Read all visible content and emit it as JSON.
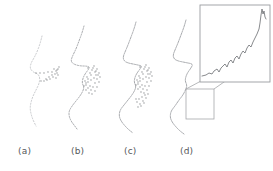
{
  "figure": {
    "type": "multi-panel-scientific-figure",
    "background_color": "#ffffff",
    "width": 273,
    "height": 171,
    "panel_count": 4
  },
  "captions": {
    "a": "(a)",
    "b": "(b)",
    "c": "(c)",
    "d": "(d)"
  },
  "colors": {
    "profile_stroke": "#8d8f94",
    "profile_stroke_light": "#b6b8bc",
    "point_marker": "#6e7074",
    "inset_border": "#9a9ca0",
    "roi_border": "#a5a7ab",
    "connector": "#8e9094",
    "inset_curve": "#6a6c70",
    "caption_text": "#55575a"
  },
  "chart_data": {
    "type": "line",
    "title": "",
    "xlabel": "",
    "ylabel": "",
    "panels": [
      {
        "id": "a",
        "label": "(a)",
        "description": "sparse scattered sample points around mid-face with short horizontal trace, faint partial contour",
        "contour_detail": "minimal",
        "point_count": 22,
        "has_inset": false,
        "has_roi_box": false,
        "contour": [
          [
            42,
            36
          ],
          [
            40,
            44
          ],
          [
            37,
            52
          ],
          [
            34,
            58
          ],
          [
            31,
            63
          ],
          [
            30,
            68
          ],
          [
            32,
            71
          ],
          [
            35,
            73
          ],
          [
            38,
            74
          ],
          [
            40,
            78
          ],
          [
            39,
            84
          ],
          [
            36,
            90
          ],
          [
            33,
            96
          ],
          [
            31,
            102
          ],
          [
            30,
            108
          ],
          [
            31,
            114
          ],
          [
            33,
            120
          ],
          [
            36,
            126
          ]
        ],
        "points": [
          [
            36,
            73
          ],
          [
            40,
            73
          ],
          [
            44,
            73
          ],
          [
            48,
            72
          ],
          [
            52,
            72
          ],
          [
            56,
            71
          ],
          [
            58,
            69
          ],
          [
            59,
            67
          ],
          [
            57,
            70
          ],
          [
            55,
            74
          ],
          [
            53,
            77
          ],
          [
            50,
            79
          ],
          [
            47,
            80
          ],
          [
            44,
            81
          ],
          [
            41,
            81
          ],
          [
            54,
            69
          ],
          [
            57,
            73
          ],
          [
            52,
            75
          ],
          [
            49,
            77
          ],
          [
            46,
            79
          ],
          [
            58,
            75
          ],
          [
            56,
            78
          ]
        ]
      },
      {
        "id": "b",
        "label": "(b)",
        "description": "partial face profile: forehead, nose bridge, nose tip, lips and chin forming with dotted point cloud near mouth",
        "contour_detail": "moderate",
        "point_count": 34,
        "has_inset": false,
        "has_roi_box": false,
        "contour": [
          [
            84,
            26
          ],
          [
            82,
            33
          ],
          [
            79,
            41
          ],
          [
            76,
            49
          ],
          [
            73,
            55
          ],
          [
            71,
            60
          ],
          [
            72,
            63
          ],
          [
            76,
            65
          ],
          [
            81,
            66
          ],
          [
            86,
            66
          ],
          [
            90,
            67
          ],
          [
            88,
            70
          ],
          [
            85,
            74
          ],
          [
            83,
            78
          ],
          [
            82,
            83
          ],
          [
            84,
            87
          ],
          [
            83,
            91
          ],
          [
            80,
            96
          ],
          [
            76,
            101
          ],
          [
            72,
            106
          ],
          [
            69,
            111
          ],
          [
            69,
            116
          ],
          [
            71,
            121
          ],
          [
            74,
            125
          ],
          [
            77,
            129
          ]
        ],
        "points": [
          [
            88,
            68
          ],
          [
            92,
            70
          ],
          [
            95,
            72
          ],
          [
            96,
            75
          ],
          [
            94,
            78
          ],
          [
            91,
            80
          ],
          [
            88,
            82
          ],
          [
            86,
            85
          ],
          [
            88,
            88
          ],
          [
            91,
            90
          ],
          [
            93,
            87
          ],
          [
            95,
            83
          ],
          [
            97,
            79
          ],
          [
            98,
            75
          ],
          [
            96,
            71
          ],
          [
            93,
            68
          ],
          [
            90,
            73
          ],
          [
            87,
            77
          ],
          [
            85,
            81
          ],
          [
            84,
            86
          ],
          [
            86,
            90
          ],
          [
            89,
            93
          ],
          [
            92,
            94
          ],
          [
            95,
            91
          ],
          [
            97,
            87
          ],
          [
            99,
            82
          ],
          [
            100,
            77
          ],
          [
            99,
            73
          ],
          [
            97,
            69
          ],
          [
            94,
            66
          ],
          [
            91,
            75
          ],
          [
            88,
            79
          ],
          [
            86,
            83
          ],
          [
            90,
            86
          ]
        ]
      },
      {
        "id": "c",
        "label": "(c)",
        "description": "denser face profile contour with fuller forehead-nose-lip-chin curve and dense dotted cluster on nose and mouth region",
        "contour_detail": "dense",
        "point_count": 46,
        "has_inset": false,
        "has_roi_box": false,
        "contour": [
          [
            136,
            22
          ],
          [
            134,
            29
          ],
          [
            131,
            37
          ],
          [
            128,
            45
          ],
          [
            125,
            52
          ],
          [
            123,
            57
          ],
          [
            124,
            61
          ],
          [
            128,
            63
          ],
          [
            133,
            64
          ],
          [
            138,
            65
          ],
          [
            142,
            66
          ],
          [
            140,
            69
          ],
          [
            137,
            73
          ],
          [
            135,
            77
          ],
          [
            134,
            82
          ],
          [
            136,
            86
          ],
          [
            135,
            90
          ],
          [
            132,
            95
          ],
          [
            128,
            100
          ],
          [
            124,
            105
          ],
          [
            120,
            110
          ],
          [
            119,
            116
          ],
          [
            121,
            121
          ],
          [
            125,
            126
          ],
          [
            129,
            130
          ],
          [
            133,
            133
          ]
        ],
        "points": [
          [
            140,
            67
          ],
          [
            144,
            69
          ],
          [
            147,
            71
          ],
          [
            148,
            74
          ],
          [
            146,
            77
          ],
          [
            143,
            79
          ],
          [
            140,
            81
          ],
          [
            138,
            84
          ],
          [
            140,
            87
          ],
          [
            143,
            89
          ],
          [
            145,
            86
          ],
          [
            147,
            82
          ],
          [
            149,
            78
          ],
          [
            150,
            74
          ],
          [
            148,
            70
          ],
          [
            145,
            67
          ],
          [
            142,
            72
          ],
          [
            139,
            76
          ],
          [
            137,
            80
          ],
          [
            136,
            85
          ],
          [
            138,
            89
          ],
          [
            141,
            92
          ],
          [
            144,
            93
          ],
          [
            147,
            90
          ],
          [
            149,
            86
          ],
          [
            151,
            81
          ],
          [
            152,
            76
          ],
          [
            151,
            72
          ],
          [
            149,
            68
          ],
          [
            146,
            65
          ],
          [
            143,
            74
          ],
          [
            140,
            78
          ],
          [
            138,
            82
          ],
          [
            142,
            85
          ],
          [
            145,
            95
          ],
          [
            142,
            97
          ],
          [
            139,
            99
          ],
          [
            137,
            102
          ],
          [
            140,
            104
          ],
          [
            143,
            101
          ],
          [
            146,
            98
          ],
          [
            148,
            94
          ],
          [
            144,
            103
          ],
          [
            141,
            106
          ],
          [
            138,
            107
          ],
          [
            136,
            99
          ]
        ]
      },
      {
        "id": "d",
        "label": "(d)",
        "description": "final face profile with region-of-interest rectangle on the chin/jaw area connected by two leader lines to a magnified inset showing a jagged monotonically rising curve",
        "contour_detail": "full",
        "point_count": 0,
        "has_inset": true,
        "has_roi_box": true,
        "contour": [
          [
            186,
            20
          ],
          [
            184,
            27
          ],
          [
            181,
            35
          ],
          [
            178,
            43
          ],
          [
            175,
            50
          ],
          [
            173,
            55
          ],
          [
            174,
            59
          ],
          [
            178,
            61
          ],
          [
            183,
            62
          ],
          [
            188,
            63
          ],
          [
            193,
            64
          ],
          [
            191,
            68
          ],
          [
            188,
            72
          ],
          [
            186,
            76
          ],
          [
            185,
            81
          ],
          [
            187,
            85
          ],
          [
            186,
            89
          ],
          [
            183,
            95
          ],
          [
            179,
            100
          ],
          [
            175,
            106
          ],
          [
            171,
            111
          ],
          [
            170,
            117
          ],
          [
            172,
            122
          ],
          [
            176,
            127
          ],
          [
            180,
            131
          ],
          [
            184,
            134
          ]
        ],
        "roi_box": {
          "x": 186,
          "y": 89,
          "width": 28,
          "height": 30
        },
        "inset_box": {
          "x": 200,
          "y": 5,
          "width": 70,
          "height": 77
        },
        "connectors": [
          {
            "from": [
              186,
              89
            ],
            "to": [
              201,
              81
            ]
          },
          {
            "from": [
              214,
              89
            ],
            "to": [
              234,
              75
            ]
          }
        ],
        "anchor_marker": {
          "x": 230,
          "y": 77,
          "size": 4
        },
        "inset_curve": {
          "description": "jagged rising curve with small sawtooth oscillations and a sharp vertical spike near the right edge",
          "x": [
            2,
            6,
            9,
            12,
            14,
            17,
            19,
            21,
            23,
            25,
            27,
            29,
            31,
            33,
            35,
            37,
            39,
            41,
            43,
            45,
            47,
            49,
            51,
            53,
            55,
            57,
            59,
            60,
            61,
            62,
            63,
            64,
            65,
            66
          ],
          "y": [
            71,
            70,
            68,
            69,
            66,
            64,
            67,
            63,
            61,
            59,
            62,
            57,
            55,
            58,
            53,
            51,
            54,
            49,
            46,
            48,
            43,
            40,
            42,
            37,
            33,
            29,
            24,
            18,
            10,
            4,
            9,
            6,
            12,
            14
          ]
        }
      }
    ]
  }
}
